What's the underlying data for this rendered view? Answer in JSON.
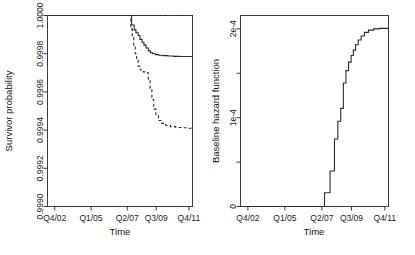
{
  "figure": {
    "title": "",
    "panel_count": 2
  },
  "chart_data": [
    {
      "type": "line",
      "panel": "left",
      "title": "",
      "xlabel": "Time",
      "ylabel": "Survivor probability",
      "xlim": [
        0,
        40
      ],
      "ylim": [
        0.999,
        1.0
      ],
      "grid": false,
      "legend": "none",
      "xticks": [
        2,
        12,
        22,
        30,
        39
      ],
      "xticklabels": [
        "Q4/02",
        "Q1/05",
        "Q2/07",
        "Q3/09",
        "Q4/11"
      ],
      "yticks": [
        0.999,
        0.9992,
        0.9994,
        0.9996,
        0.9998,
        1.0
      ],
      "yticklabels": [
        "0.9990",
        "0.9992",
        "0.9994",
        "0.9996",
        "0.9998",
        "1.0000"
      ],
      "series": [
        {
          "name": "reference-flat",
          "style": "dashed",
          "step": false,
          "x": [
            23.2,
            40.0
          ],
          "y": [
            1.0,
            1.0
          ]
        },
        {
          "name": "survivor-solid",
          "style": "solid",
          "step": true,
          "x": [
            0.0,
            22.6,
            23.2,
            23.9,
            24.4,
            25.0,
            25.5,
            26.1,
            26.6,
            27.2,
            27.8,
            28.4,
            29.0,
            29.8,
            30.7,
            31.8,
            33.2,
            34.8,
            36.6,
            38.4,
            40.0
          ],
          "y": [
            1.0,
            1.0,
            0.99995,
            0.999925,
            0.99991,
            0.999895,
            0.999875,
            0.99986,
            0.999845,
            0.99983,
            0.999815,
            0.999805,
            0.9998,
            0.999795,
            0.999792,
            0.99979,
            0.999788,
            0.999786,
            0.999785,
            0.999785,
            0.999785
          ]
        },
        {
          "name": "survivor-dashed",
          "style": "dashed",
          "step": true,
          "x": [
            0.0,
            22.6,
            23.0,
            23.4,
            23.8,
            24.2,
            24.6,
            25.0,
            25.6,
            26.4,
            27.2,
            27.8,
            28.3,
            28.8,
            29.3,
            29.9,
            30.6,
            31.5,
            32.6,
            33.9,
            35.4,
            37.0,
            38.6,
            40.0
          ],
          "y": [
            1.0,
            1.0,
            0.99993,
            0.999885,
            0.99984,
            0.9998,
            0.999765,
            0.999735,
            0.999715,
            0.999705,
            0.9997,
            0.99966,
            0.99961,
            0.99956,
            0.99951,
            0.999475,
            0.99945,
            0.999435,
            0.999425,
            0.999418,
            0.999414,
            0.999412,
            0.99941,
            0.99941
          ]
        }
      ]
    },
    {
      "type": "line",
      "panel": "right",
      "title": "",
      "xlabel": "Time",
      "ylabel": "Baseline hazard function",
      "xlim": [
        0,
        40
      ],
      "ylim": [
        0,
        0.000215
      ],
      "grid": false,
      "legend": "none",
      "xticks": [
        2,
        12,
        22,
        30,
        39
      ],
      "xticklabels": [
        "Q4/02",
        "Q1/05",
        "Q2/07",
        "Q3/09",
        "Q4/11"
      ],
      "yticks": [
        0,
        5e-05,
        0.0001,
        0.00015,
        0.0002
      ],
      "yticklabels": [
        "0",
        "",
        "1e-4",
        "",
        "2e-4"
      ],
      "series": [
        {
          "name": "baseline-hazard",
          "style": "solid",
          "step": true,
          "x": [
            0.0,
            22.7,
            22.7,
            24.2,
            24.2,
            25.4,
            25.4,
            26.3,
            26.3,
            27.1,
            27.1,
            27.8,
            27.8,
            28.5,
            28.5,
            29.2,
            29.2,
            29.9,
            29.9,
            30.5,
            30.5,
            31.1,
            31.1,
            31.8,
            31.8,
            32.6,
            32.6,
            33.5,
            33.5,
            34.6,
            34.6,
            36.0,
            36.0,
            37.6,
            37.6,
            40.0
          ],
          "y": [
            0.0,
            0.0,
            1.55e-05,
            1.55e-05,
            4e-05,
            4e-05,
            7.6e-05,
            7.6e-05,
            9.6e-05,
            9.6e-05,
            0.0001105,
            0.0001105,
            0.000139,
            0.000139,
            0.000153,
            0.000153,
            0.0001625,
            0.0001625,
            0.00017,
            0.00017,
            0.000176,
            0.000176,
            0.000182,
            0.000182,
            0.0001875,
            0.0001875,
            0.000192,
            0.000192,
            0.000196,
            0.000196,
            0.0001985,
            0.0001985,
            0.0002,
            0.0002,
            0.0002005,
            0.0002005
          ]
        }
      ]
    }
  ]
}
